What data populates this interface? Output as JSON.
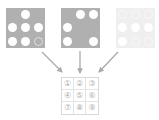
{
  "figure": {
    "title": "",
    "background_color": "#ffffff"
  },
  "panels": [
    {
      "name": "panel-left",
      "face_color": "#b0b0b0",
      "dot_color": "#ffffff",
      "visible_dot_count": 6,
      "dot_cells": [
        2,
        4,
        5,
        6,
        7,
        8
      ],
      "faint_dot_cells": [
        9
      ],
      "opacity": "1.0"
    },
    {
      "name": "panel-middle",
      "face_color": "#b0b0b0",
      "dot_color": "#ffffff",
      "visible_dot_count": 5,
      "dot_cells": [
        2,
        3,
        4,
        7,
        9
      ],
      "faint_dot_cells": [],
      "opacity": "1.0"
    },
    {
      "name": "panel-right",
      "face_color": "#dcdcdc",
      "dot_color": "#ffffff",
      "visible_dot_count": 4,
      "dot_cells": [
        4,
        5,
        6,
        7
      ],
      "faint_dot_cells": [
        1,
        2,
        3,
        8,
        9
      ],
      "opacity": "0.45"
    }
  ],
  "arrows": {
    "color": "#aaaaaa",
    "items": [
      {
        "label": "arrow-left-to-grid",
        "direction": "down-right"
      },
      {
        "label": "arrow-middle-to-grid",
        "direction": "down"
      },
      {
        "label": "arrow-right-to-grid",
        "direction": "down-left"
      }
    ]
  },
  "number_grid": {
    "rows": 3,
    "cols": 3,
    "border_color": "#d9d9d9",
    "text_color": "#b0b0b0",
    "cells": [
      "①",
      "②",
      "③",
      "④",
      "⑤",
      "⑥",
      "⑦",
      "⑧",
      "⑨"
    ]
  }
}
